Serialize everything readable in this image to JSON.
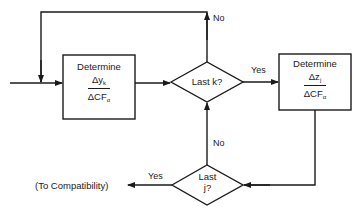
{
  "diagram": {
    "nodes": {
      "box_left": {
        "title": "Determine",
        "numerator": "Δy",
        "numerator_sub": "k",
        "denominator": "ΔCF",
        "denominator_sub": "α"
      },
      "decision_top": {
        "label": "Last k?"
      },
      "box_right": {
        "title": "Determine",
        "numerator": "Δz",
        "numerator_sub": "j",
        "denominator": "ΔCF",
        "denominator_sub": "α"
      },
      "decision_bottom": {
        "line1": "Last",
        "line2": "j?"
      },
      "exit": {
        "label": "(To Compatibility)"
      }
    },
    "edges": {
      "top_no": "No",
      "top_yes": "Yes",
      "bottom_no": "No",
      "bottom_yes": "Yes"
    },
    "colors": {
      "stroke": "#1a1a1a",
      "background": "#ffffff"
    }
  }
}
